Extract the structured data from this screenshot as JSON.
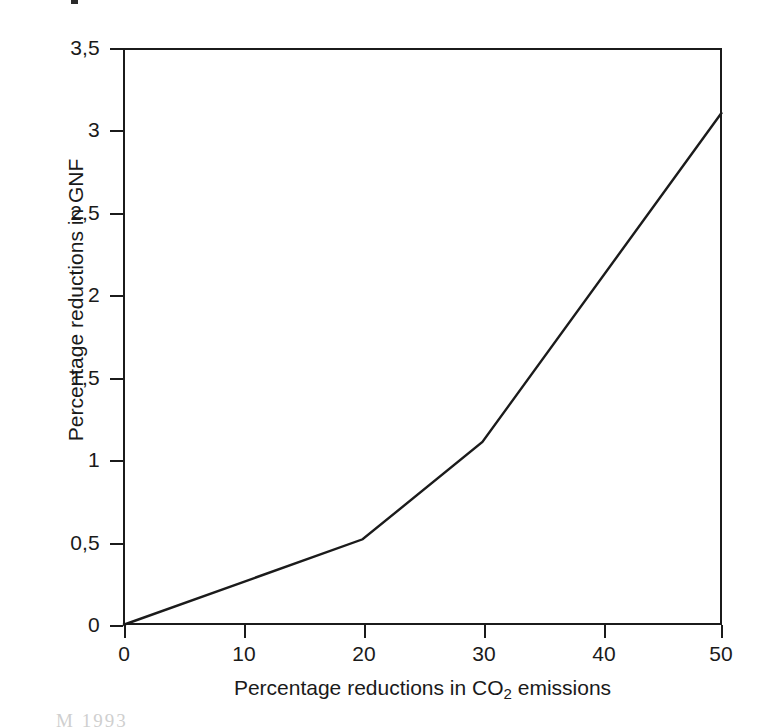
{
  "chart_data": {
    "type": "line",
    "title": "",
    "xlabel_prefix": "Percentage reductions in CO",
    "xlabel_sub": "2",
    "xlabel_suffix": " emissions",
    "xlabel": "Percentage reductions in CO2 emissions",
    "ylabel": "Percentage reductions in GNF",
    "x": [
      0,
      20,
      30,
      50
    ],
    "values": [
      0,
      0.52,
      1.11,
      3.11
    ],
    "series": [
      {
        "name": "Percentage reductions in GNF",
        "x": [
          0,
          20,
          30,
          50
        ],
        "values": [
          0,
          0.52,
          1.11,
          3.11
        ],
        "color": "#1b1b1b"
      }
    ],
    "xlim": [
      0,
      50
    ],
    "ylim": [
      0,
      3.5
    ],
    "xticks": [
      0,
      10,
      20,
      30,
      40,
      50
    ],
    "yticks": [
      0,
      0.5,
      1,
      1.5,
      2,
      2.5,
      3,
      3.5
    ],
    "xticklabels": [
      "0",
      "10",
      "20",
      "30",
      "40",
      "50"
    ],
    "yticklabels": [
      "0",
      "0,5",
      "1",
      "1,5",
      "2",
      "2,5",
      "3",
      "3,5"
    ],
    "decimal_separator": ",",
    "grid": false,
    "legend": null,
    "line_color": "#1b1b1b",
    "line_width": 2.4,
    "frame_color": "#1b1b1b",
    "background": "#ffffff"
  },
  "artifacts": {
    "bottom_caption": "M     1993",
    "top_speck": ""
  }
}
